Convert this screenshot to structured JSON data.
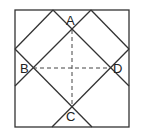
{
  "diagram": {
    "type": "geometry",
    "square": {
      "x1": 15,
      "y1": 10,
      "x2": 129,
      "y2": 127
    },
    "points": {
      "A": {
        "label": "A",
        "x": 72,
        "y": 30
      },
      "B": {
        "label": "B",
        "x": 33,
        "y": 68
      },
      "C": {
        "label": "C",
        "x": 72,
        "y": 107
      },
      "D": {
        "label": "D",
        "x": 110,
        "y": 68
      }
    },
    "colors": {
      "line": "#333333",
      "background": "#ffffff"
    }
  }
}
